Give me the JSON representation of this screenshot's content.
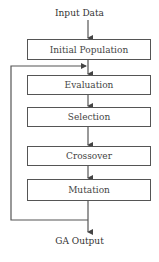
{
  "diagram": {
    "input_label": "Input Data",
    "output_label": "GA Output",
    "steps": [
      {
        "label": "Initial Population"
      },
      {
        "label": "Evaluation"
      },
      {
        "label": "Selection"
      },
      {
        "label": "Crossover"
      },
      {
        "label": "Mutation"
      }
    ],
    "loop": {
      "from": "Mutation",
      "to": "Evaluation",
      "side": "left"
    },
    "colors": {
      "stroke": "#555555",
      "text": "#444444",
      "background": "#ffffff"
    }
  }
}
